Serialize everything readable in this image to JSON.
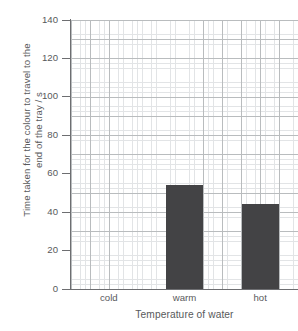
{
  "chart_data": {
    "type": "bar",
    "title": "",
    "subtitle": "",
    "categories": [
      "cold",
      "warm",
      "hot"
    ],
    "values": [
      0,
      54,
      44
    ],
    "xlabel": "Temperature of water",
    "ylabel": "Time taken for the colour to travel to the end of the tray / s",
    "ylabel_line1": "Time taken for the colour to travel to the",
    "ylabel_line2": "end of the tray / s",
    "ylim": [
      0,
      140
    ],
    "ytick_step": 20,
    "yticks": [
      0,
      20,
      40,
      60,
      80,
      100,
      120,
      140
    ],
    "ytick_labels": [
      "0",
      "20",
      "40",
      "60",
      "80",
      "100",
      "120",
      "140"
    ],
    "grid": true,
    "grid_minor": true,
    "grid_minor_step": 5,
    "legend": "none",
    "bar_color": "#434345",
    "grid_major_color": "#b9bcbe",
    "grid_minor_color": "#e2e4e6",
    "axis_color": "#6d6e71",
    "text_color": "#58595b",
    "background_color": "#ffffff"
  }
}
